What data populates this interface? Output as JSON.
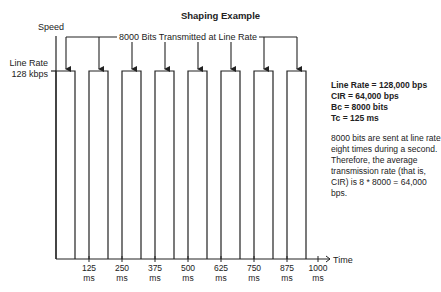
{
  "diagram": {
    "title": "Shaping Example",
    "y_axis_label": "Speed",
    "x_axis_label": "Time",
    "line_rate_label_line1": "Line Rate",
    "line_rate_label_line2": "128 kbps",
    "banner_label": "8000 Bits Transmitted at Line Rate",
    "time_ticks": [
      {
        "value": "125",
        "unit": "ms"
      },
      {
        "value": "250",
        "unit": "ms"
      },
      {
        "value": "375",
        "unit": "ms"
      },
      {
        "value": "500",
        "unit": "ms"
      },
      {
        "value": "625",
        "unit": "ms"
      },
      {
        "value": "750",
        "unit": "ms"
      },
      {
        "value": "875",
        "unit": "ms"
      },
      {
        "value": "1000",
        "unit": "ms"
      }
    ],
    "pulse_count": 8,
    "params": [
      "Line Rate = 128,000 bps",
      "CIR = 64,000 bps",
      "Bc = 8000 bits",
      "Tc = 125 ms"
    ],
    "description": "8000 bits are sent at line rate eight times during a second. Therefore, the average transmission rate (that is, CIR) is 8 * 8000 = 64,000 bps.",
    "colors": {
      "line": "#222222",
      "background": "#ffffff"
    }
  }
}
